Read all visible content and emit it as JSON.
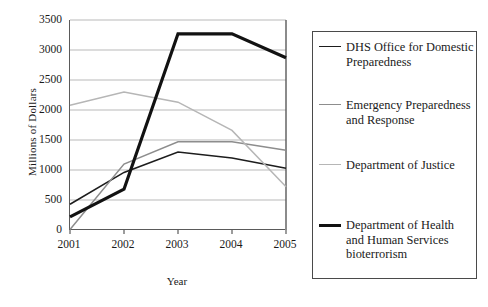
{
  "chart_data": {
    "type": "line",
    "title": "",
    "xlabel": "Year",
    "ylabel": "Millions of Dollars",
    "categories": [
      "2001",
      "2002",
      "2003",
      "2004",
      "2005"
    ],
    "x": [
      2001,
      2002,
      2003,
      2004,
      2005
    ],
    "ylim": [
      0,
      3500
    ],
    "yticks": [
      0,
      500,
      1000,
      1500,
      2000,
      2500,
      3000,
      3500
    ],
    "grid": "horizontal",
    "legend_position": "right",
    "series": [
      {
        "name": "DHS Office for Domestic Preparedness",
        "values": [
          430,
          960,
          1300,
          1200,
          1030
        ],
        "color": "#1d1d1d",
        "width": 1.6
      },
      {
        "name": "Emergency Preparedness and Response",
        "values": [
          10,
          1100,
          1470,
          1470,
          1330
        ],
        "color": "#8d8d8d",
        "width": 1.5
      },
      {
        "name": "Department of Justice",
        "values": [
          2080,
          2300,
          2130,
          1660,
          720
        ],
        "color": "#b6b6b6",
        "width": 1.5
      },
      {
        "name": "Department of Health and Human Services bioterrorism",
        "values": [
          220,
          680,
          3270,
          3270,
          2870
        ],
        "color": "#121212",
        "width": 3.2
      }
    ]
  },
  "axis": {
    "y_tick_labels": [
      "3500",
      "3000",
      "2500",
      "2000",
      "1500",
      "1000",
      "500",
      "0"
    ],
    "x_tick_labels": [
      "2001",
      "2002",
      "2003",
      "2004",
      "2005"
    ],
    "y_title": "Millions of Dollars",
    "x_title": "Year"
  },
  "legend": {
    "items": [
      {
        "label": "DHS Office for Domestic Preparedness",
        "color": "#1d1d1d",
        "width": "1.6px"
      },
      {
        "label": "Emergency Preparedness and Response",
        "color": "#8d8d8d",
        "width": "1.5px"
      },
      {
        "label": "Department of Justice",
        "color": "#b6b6b6",
        "width": "1.5px"
      },
      {
        "label": "Department of Health and Human Services bioterrorism",
        "color": "#121212",
        "width": "3.2px"
      }
    ]
  }
}
